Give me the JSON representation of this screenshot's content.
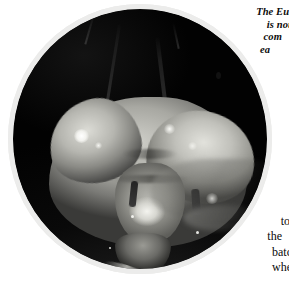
{
  "page": {
    "background_color": "#ffffff",
    "kind": "book-page-scan"
  },
  "photo": {
    "name": "praying-mantis-head-closeup",
    "shape": "circle",
    "palette": "grayscale",
    "background_color": "#030303",
    "frame_color": "#ececeb",
    "subject": "European praying mantis head in macro, showing compound eyes, antennae and triangular face",
    "elements": {
      "left_eye": "compound-eye",
      "right_eye": "compound-eye",
      "left_antenna": "antenna",
      "right_antenna": "antenna",
      "face_plate": "clypeus",
      "mouthparts": "mandibles"
    }
  },
  "text_top": {
    "style": "italic-serif",
    "lines": [
      "The Europ",
      "is nou",
      "com",
      "ea"
    ]
  },
  "text_bottom": {
    "style": "roman-serif",
    "lines": [
      "f",
      "to",
      "the",
      "batch",
      "when"
    ]
  }
}
